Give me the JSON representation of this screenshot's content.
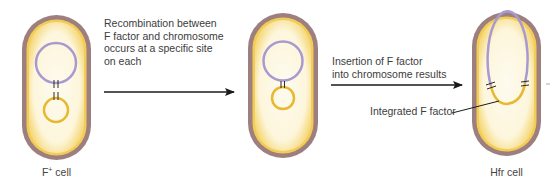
{
  "diagram": {
    "steps": [
      {
        "cell_label_base": "F",
        "cell_label_sup": "+",
        "cell_label_rest": " cell",
        "arrow_text": [
          "Recombination between",
          "F factor and chromosome",
          "occurs at a specific site",
          "on each"
        ]
      },
      {
        "cell_label": "",
        "arrow_text": [
          "Insertion of F factor",
          "into chromosome results"
        ]
      },
      {
        "cell_label": "Hfr cell",
        "callout": "Integrated F factor"
      }
    ],
    "colors": {
      "cell_wall": "#9e7f7f",
      "cell_inner_glow": "#f2c94c",
      "cytoplasm": "#fdf8e6",
      "chromosome": "#a89ad0",
      "f_factor": "#e8b830",
      "arrow": "#1a1a1a",
      "text": "#3c3c3c"
    }
  }
}
